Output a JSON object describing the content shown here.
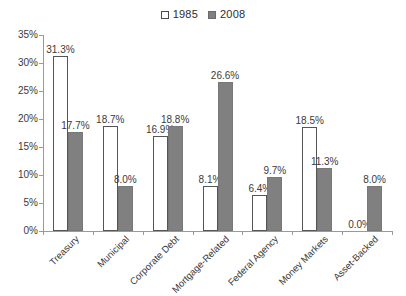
{
  "chart_data": {
    "type": "bar",
    "title": "",
    "subtitle": "",
    "xlabel": "",
    "ylabel": "",
    "ylim": [
      0,
      35
    ],
    "ytick_labels": [
      "0%",
      "5%",
      "10%",
      "15%",
      "20%",
      "25%",
      "30%",
      "35%"
    ],
    "ytick_values": [
      0,
      5,
      10,
      15,
      20,
      25,
      30,
      35
    ],
    "grid": false,
    "legend_position": "top-center",
    "categories": [
      "Treasury",
      "Municipal",
      "Corporate Debt",
      "Mortgage-Related",
      "Federal Agency",
      "Money Markets",
      "Asset-Backed"
    ],
    "series": [
      {
        "name": "1985",
        "color": "#ffffff",
        "edge_color": "#555555",
        "values": [
          31.3,
          18.7,
          16.9,
          8.1,
          6.4,
          18.5,
          0.0
        ],
        "labels": [
          "31.3%",
          "18.7%",
          "16.9%",
          "8.1%",
          "6.4%",
          "18.5%",
          "0.0%"
        ]
      },
      {
        "name": "2008",
        "color": "#808080",
        "edge_color": "#787878",
        "values": [
          17.7,
          8.0,
          18.8,
          26.6,
          9.7,
          11.3,
          8.0
        ],
        "labels": [
          "17.7%",
          "8.0%",
          "18.8%",
          "26.6%",
          "9.7%",
          "11.3%",
          "8.0%"
        ]
      }
    ]
  },
  "legend": {
    "entries": [
      {
        "label": "1985",
        "marker": "hollow-square-marker"
      },
      {
        "label": "2008",
        "marker": "filled-square-marker"
      }
    ]
  },
  "colors": {
    "axis": "#9a9a9a",
    "text": "#3a3a3a",
    "series_1985": "#ffffff",
    "series_2008": "#808080",
    "background": "#ffffff"
  }
}
